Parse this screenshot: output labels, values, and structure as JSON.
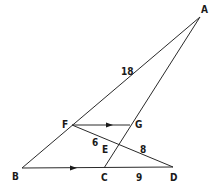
{
  "diagram": {
    "type": "geometry",
    "points": {
      "A": {
        "label": "A",
        "x": 200,
        "y": 17,
        "lx": 201,
        "ly": 13
      },
      "B": {
        "label": "B",
        "x": 22,
        "y": 168,
        "lx": 12,
        "ly": 180
      },
      "C": {
        "label": "C",
        "x": 104,
        "y": 168,
        "lx": 101,
        "ly": 181
      },
      "D": {
        "label": "D",
        "x": 173,
        "y": 167,
        "lx": 171,
        "ly": 181
      },
      "E": {
        "label": "E",
        "x": 118,
        "y": 144,
        "lx": 102,
        "ly": 153
      },
      "F": {
        "label": "F",
        "x": 72,
        "y": 125,
        "lx": 62,
        "ly": 128
      },
      "G": {
        "label": "G",
        "x": 130,
        "y": 125,
        "lx": 135,
        "ly": 128
      }
    },
    "segments": [
      {
        "from": "A",
        "to": "B"
      },
      {
        "from": "A",
        "to": "C"
      },
      {
        "from": "B",
        "to": "D"
      },
      {
        "from": "F",
        "to": "D"
      },
      {
        "from": "F",
        "to": "G"
      }
    ],
    "parallel_marks": [
      {
        "segment": "FG",
        "x": 110,
        "y": 125
      },
      {
        "segment": "BC",
        "x": 74,
        "y": 168
      }
    ],
    "length_labels": [
      {
        "text": "18",
        "segment": "AF",
        "x": 122,
        "y": 75
      },
      {
        "text": "6",
        "segment": "FE",
        "x": 92,
        "y": 146
      },
      {
        "text": "8",
        "segment": "ED",
        "x": 140,
        "y": 152
      },
      {
        "text": "9",
        "segment": "CD",
        "x": 136,
        "y": 181
      }
    ]
  }
}
